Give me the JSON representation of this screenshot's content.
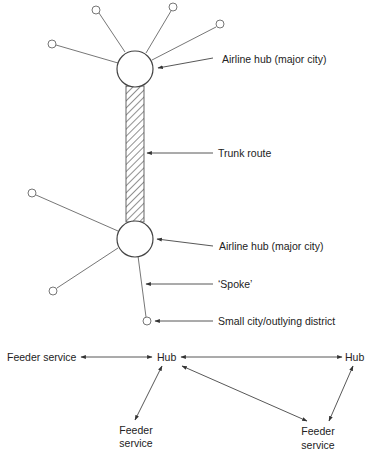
{
  "diagram": {
    "colors": {
      "line": "#555555",
      "text": "#222222",
      "background": "#ffffff"
    },
    "network": {
      "hubs": [
        {
          "id": "hub-top",
          "label": "Airline hub (major city)"
        },
        {
          "id": "hub-bottom",
          "label": "Airline hub (major city)"
        }
      ],
      "trunk": {
        "label": "Trunk route"
      },
      "spoke": {
        "label": "‘Spoke’"
      },
      "small_city": {
        "label": "Small city/outlying district"
      }
    },
    "flow": {
      "feeder_left": "Feeder service",
      "hub_center": "Hub",
      "hub_right": "Hub",
      "feeder_bottom_left_line1": "Feeder",
      "feeder_bottom_left_line2": "service",
      "feeder_bottom_right_line1": "Feeder",
      "feeder_bottom_right_line2": "service"
    }
  }
}
